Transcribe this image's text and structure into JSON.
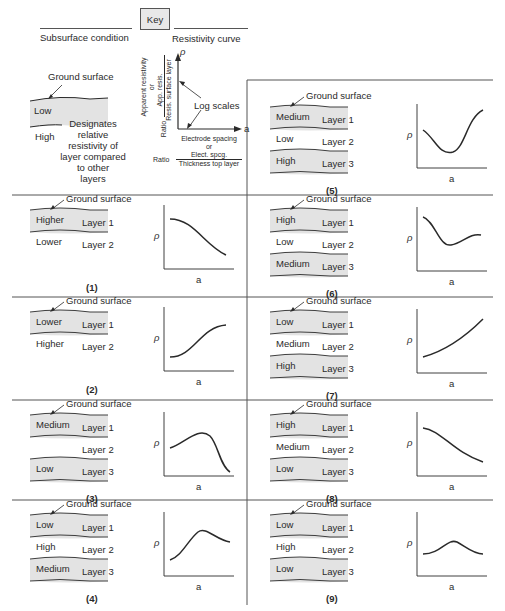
{
  "header": {
    "key_label": "Key",
    "left_heading": "Subsurface condition",
    "right_heading": "Resistivity curve"
  },
  "key_panel": {
    "ground_surface": "Ground surface",
    "upper_layer": "Low",
    "lower_layer": "High",
    "note_lines": [
      "Designates",
      "relative",
      "resistivity of",
      "layer compared",
      "to other",
      "layers"
    ],
    "y_axis_symbol": "ρ",
    "x_axis_symbol": "a",
    "y_label_1": "Apparent resistivity",
    "y_label_or": "or",
    "y_label_num": "App. resis.",
    "y_label_den": "Resis. surface layer",
    "y_label_ratio": "Ratio",
    "log_scales": "Log scales",
    "x_label_1": "Electrode spacing",
    "x_label_or": "or",
    "x_label_num": "Elect. spcg.",
    "x_label_den": "Thickness top layer",
    "x_label_ratio": "Ratio"
  },
  "panels": [
    {
      "num": "(1)",
      "ground": "Ground surface",
      "layers": [
        {
          "res": "Higher",
          "name": "Layer 1",
          "shaded": true
        },
        {
          "res": "Lower",
          "name": "Layer 2",
          "shaded": false
        }
      ],
      "curve": "descending"
    },
    {
      "num": "(2)",
      "ground": "Ground surface",
      "layers": [
        {
          "res": "Lower",
          "name": "Layer 1",
          "shaded": true
        },
        {
          "res": "Higher",
          "name": "Layer 2",
          "shaded": false
        }
      ],
      "curve": "ascending"
    },
    {
      "num": "(3)",
      "ground": "Ground surface",
      "layers": [
        {
          "res": "Medium",
          "name": "Layer 1",
          "shaded": true
        },
        {
          "res": "",
          "name": "Layer 2",
          "shaded": false
        },
        {
          "res": "Low",
          "name": "Layer 3",
          "shaded": true
        }
      ],
      "curve": "peak-then-drop"
    },
    {
      "num": "(4)",
      "ground": "Ground surface",
      "layers": [
        {
          "res": "Low",
          "name": "Layer 1",
          "shaded": true
        },
        {
          "res": "High",
          "name": "Layer 2",
          "shaded": false
        },
        {
          "res": "Medium",
          "name": "Layer 3",
          "shaded": true
        }
      ],
      "curve": "rise-peak-settle"
    },
    {
      "num": "(5)",
      "ground": "Ground surface",
      "layers": [
        {
          "res": "Medium",
          "name": "Layer 1",
          "shaded": true
        },
        {
          "res": "Low",
          "name": "Layer 2",
          "shaded": false
        },
        {
          "res": "High",
          "name": "Layer 3",
          "shaded": true
        }
      ],
      "curve": "dip-then-rise"
    },
    {
      "num": "(6)",
      "ground": "Ground surface",
      "layers": [
        {
          "res": "High",
          "name": "Layer 1",
          "shaded": true
        },
        {
          "res": "Low",
          "name": "Layer 2",
          "shaded": false
        },
        {
          "res": "Medium",
          "name": "Layer 3",
          "shaded": true
        }
      ],
      "curve": "drop-dip-settle"
    },
    {
      "num": "(7)",
      "ground": "Ground surface",
      "layers": [
        {
          "res": "Low",
          "name": "Layer 1",
          "shaded": true
        },
        {
          "res": "Medium",
          "name": "Layer 2",
          "shaded": false
        },
        {
          "res": "High",
          "name": "Layer 3",
          "shaded": true
        }
      ],
      "curve": "steady-rise"
    },
    {
      "num": "(8)",
      "ground": "Ground surface",
      "layers": [
        {
          "res": "High",
          "name": "Layer 1",
          "shaded": true
        },
        {
          "res": "Medium",
          "name": "Layer 2",
          "shaded": false
        },
        {
          "res": "Low",
          "name": "Layer 3",
          "shaded": true
        }
      ],
      "curve": "steady-fall"
    },
    {
      "num": "(9)",
      "ground": "Ground surface",
      "layers": [
        {
          "res": "Low",
          "name": "Layer 1",
          "shaded": true
        },
        {
          "res": "High",
          "name": "Layer 2",
          "shaded": false
        },
        {
          "res": "Low",
          "name": "Layer 3",
          "shaded": true
        }
      ],
      "curve": "gentle-hump"
    }
  ],
  "axis": {
    "y": "ρ",
    "x": "a"
  },
  "colors": {
    "shade": "#e3e3e3",
    "line": "#2a2a2a",
    "frame": "#555555"
  }
}
